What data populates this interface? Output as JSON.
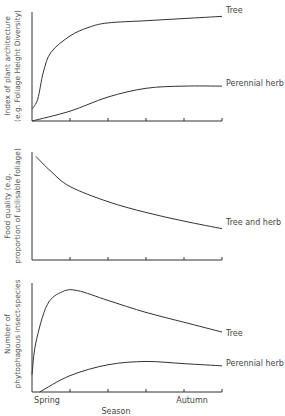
{
  "chart_data": [
    {
      "type": "line",
      "title": "",
      "xlabel": "",
      "ylabel_line1": "Index of plant architecture",
      "ylabel_line2": "(e.g. Foliage Height Diversity)",
      "xlim": [
        0,
        5
      ],
      "ylim": [
        0,
        100
      ],
      "x_ticks": [
        1,
        2,
        3,
        4,
        5
      ],
      "grid": false,
      "series": [
        {
          "name": "Tree",
          "x": [
            0,
            0.15,
            0.3,
            0.5,
            1,
            1.5,
            2,
            3,
            4,
            5
          ],
          "values": [
            11,
            20,
            45,
            63,
            78,
            86,
            90,
            92,
            94,
            96
          ]
        },
        {
          "name": "Perennial herb",
          "x": [
            0,
            1,
            2,
            3,
            4,
            5
          ],
          "values": [
            0,
            9,
            22,
            30,
            32,
            32
          ]
        }
      ]
    },
    {
      "type": "line",
      "title": "",
      "xlabel": "",
      "ylabel_line1": "Food quality (e.g.",
      "ylabel_line2": "proportion of utilisable foliage)",
      "xlim": [
        0,
        5
      ],
      "ylim": [
        0,
        100
      ],
      "x_ticks": [
        1,
        2,
        3,
        4,
        5
      ],
      "grid": false,
      "series": [
        {
          "name": "Tree and herb",
          "x": [
            0.1,
            0.5,
            1,
            2,
            3,
            4,
            5
          ],
          "values": [
            96,
            82,
            68,
            54,
            44,
            36,
            29
          ]
        }
      ]
    },
    {
      "type": "line",
      "title": "",
      "xlabel": "Season",
      "ylabel_line1": "Number of",
      "ylabel_line2": "phytophagous insect-species",
      "xlim": [
        0,
        5
      ],
      "ylim": [
        0,
        100
      ],
      "x_ticks": [
        1,
        2,
        3,
        4,
        5
      ],
      "x_tick_labels": [
        {
          "x": 0.4,
          "label": "Spring"
        },
        {
          "x": 4.2,
          "label": "Autumn"
        }
      ],
      "grid": false,
      "series": [
        {
          "name": "Tree",
          "x": [
            0,
            0.1,
            0.4,
            0.8,
            1.2,
            2,
            3,
            4,
            5
          ],
          "values": [
            16,
            45,
            80,
            92,
            93,
            84,
            73,
            64,
            55
          ]
        },
        {
          "name": "Perennial herb",
          "x": [
            0.2,
            1,
            2,
            3,
            4,
            5
          ],
          "values": [
            0,
            15,
            25,
            28,
            26,
            24
          ]
        }
      ]
    }
  ]
}
